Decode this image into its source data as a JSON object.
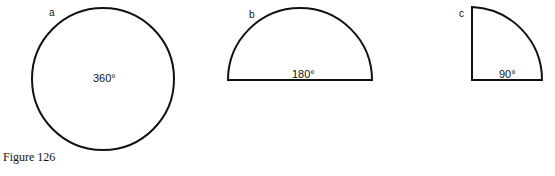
{
  "figure": {
    "caption": "Figure 126",
    "panels": [
      {
        "label": "a",
        "angle": "360°",
        "shape": "full circle"
      },
      {
        "label": "b",
        "angle": "180°",
        "shape": "semicircle"
      },
      {
        "label": "c",
        "angle": "90°",
        "shape": "quarter circle"
      }
    ]
  }
}
